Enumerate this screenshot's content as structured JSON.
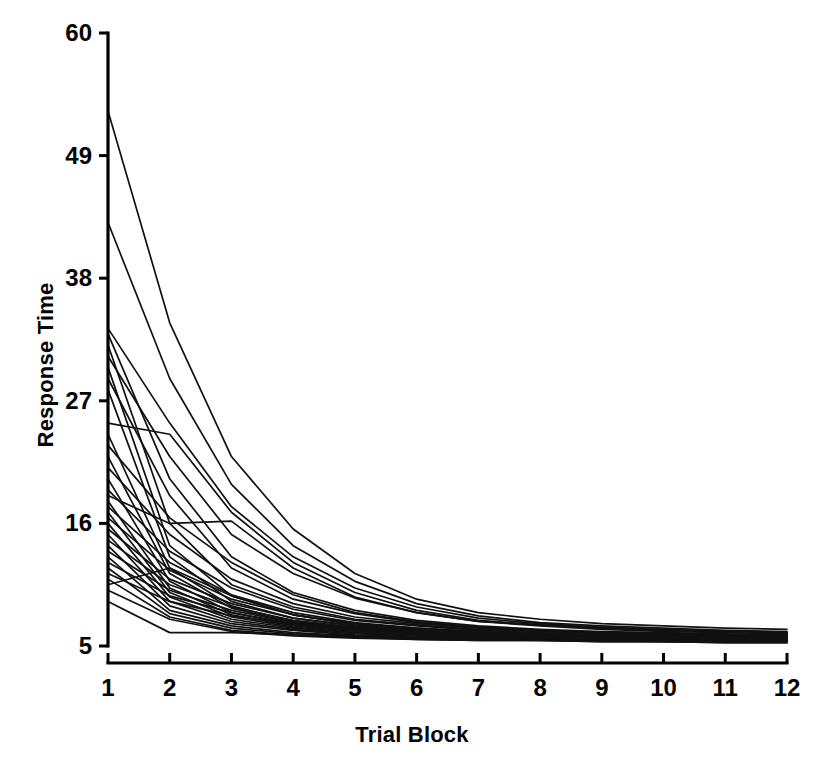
{
  "chart_data": {
    "type": "line",
    "title": "",
    "subtitle": "",
    "xlabel": "Trial Block",
    "ylabel": "Response Time",
    "x": [
      1,
      2,
      3,
      4,
      5,
      6,
      7,
      8,
      9,
      10,
      11,
      12
    ],
    "xticklabels": [
      "1",
      "2",
      "3",
      "4",
      "5",
      "6",
      "7",
      "8",
      "9",
      "10",
      "11",
      "12"
    ],
    "yticks": [
      5,
      16,
      27,
      38,
      49,
      60
    ],
    "yticklabels": [
      "5",
      "16",
      "27",
      "38",
      "49",
      "60"
    ],
    "xlim": [
      1,
      12
    ],
    "ylim": [
      5,
      60
    ],
    "grid": false,
    "legend": false,
    "legend_position": "none",
    "line_color": "#111111",
    "background_color": "#ffffff",
    "axis_color": "#000000",
    "series": [
      {
        "name": "s1",
        "values": [
          53.0,
          34.0,
          22.0,
          15.5,
          11.5,
          9.2,
          8.0,
          7.4,
          7.0,
          6.8,
          6.6,
          6.5
        ]
      },
      {
        "name": "s2",
        "values": [
          43.0,
          29.0,
          19.5,
          14.0,
          10.8,
          8.8,
          7.7,
          7.1,
          6.8,
          6.6,
          6.4,
          6.3
        ]
      },
      {
        "name": "s3",
        "values": [
          33.5,
          25.0,
          17.5,
          13.0,
          10.2,
          8.5,
          7.5,
          7.0,
          6.7,
          6.5,
          6.3,
          6.2
        ]
      },
      {
        "name": "s4",
        "values": [
          33.0,
          20.0,
          13.0,
          9.8,
          8.2,
          7.3,
          6.8,
          6.5,
          6.3,
          6.2,
          6.1,
          6.0
        ]
      },
      {
        "name": "s5",
        "values": [
          32.0,
          16.0,
          10.5,
          8.5,
          7.4,
          6.9,
          6.5,
          6.3,
          6.2,
          6.1,
          6.0,
          6.0
        ]
      },
      {
        "name": "s6",
        "values": [
          31.0,
          22.0,
          15.0,
          11.5,
          9.3,
          8.0,
          7.2,
          6.9,
          6.6,
          6.4,
          6.3,
          6.2
        ]
      },
      {
        "name": "s7",
        "values": [
          30.0,
          14.0,
          9.5,
          7.8,
          7.0,
          6.6,
          6.3,
          6.1,
          6.0,
          6.0,
          5.9,
          5.9
        ]
      },
      {
        "name": "s8",
        "values": [
          29.0,
          18.5,
          12.0,
          9.2,
          7.9,
          7.1,
          6.7,
          6.4,
          6.2,
          6.1,
          6.0,
          6.0
        ]
      },
      {
        "name": "s9",
        "values": [
          28.0,
          13.0,
          9.0,
          7.5,
          6.8,
          6.4,
          6.2,
          6.0,
          5.9,
          5.9,
          5.8,
          5.8
        ]
      },
      {
        "name": "s10",
        "values": [
          25.0,
          24.0,
          17.0,
          12.5,
          9.8,
          8.2,
          7.3,
          6.9,
          6.6,
          6.4,
          6.3,
          6.2
        ]
      },
      {
        "name": "s11",
        "values": [
          24.0,
          12.0,
          8.6,
          7.2,
          6.6,
          6.3,
          6.1,
          6.0,
          5.9,
          5.8,
          5.8,
          5.7
        ]
      },
      {
        "name": "s12",
        "values": [
          23.0,
          16.5,
          12.5,
          9.6,
          8.0,
          7.2,
          6.7,
          6.4,
          6.2,
          6.1,
          6.0,
          6.0
        ]
      },
      {
        "name": "s13",
        "values": [
          22.0,
          11.5,
          8.4,
          7.1,
          6.5,
          6.2,
          6.0,
          5.9,
          5.8,
          5.8,
          5.7,
          5.7
        ]
      },
      {
        "name": "s14",
        "values": [
          21.0,
          15.0,
          11.0,
          8.8,
          7.6,
          7.0,
          6.6,
          6.3,
          6.1,
          6.0,
          6.0,
          5.9
        ]
      },
      {
        "name": "s15",
        "values": [
          20.0,
          10.8,
          8.0,
          6.9,
          6.4,
          6.1,
          6.0,
          5.9,
          5.8,
          5.7,
          5.7,
          5.6
        ]
      },
      {
        "name": "s16",
        "values": [
          19.0,
          13.5,
          10.2,
          8.3,
          7.3,
          6.8,
          6.4,
          6.2,
          6.0,
          6.0,
          5.9,
          5.9
        ]
      },
      {
        "name": "s17",
        "values": [
          18.5,
          16.0,
          16.2,
          12.0,
          9.4,
          8.0,
          7.2,
          6.8,
          6.5,
          6.3,
          6.2,
          6.1
        ]
      },
      {
        "name": "s18",
        "values": [
          18.0,
          10.2,
          7.8,
          6.8,
          6.3,
          6.1,
          5.9,
          5.8,
          5.8,
          5.7,
          5.7,
          5.6
        ]
      },
      {
        "name": "s19",
        "values": [
          17.5,
          12.5,
          9.6,
          8.0,
          7.1,
          6.6,
          6.3,
          6.1,
          6.0,
          5.9,
          5.9,
          5.8
        ]
      },
      {
        "name": "s20",
        "values": [
          17.0,
          9.8,
          7.6,
          6.7,
          6.2,
          6.0,
          5.9,
          5.8,
          5.7,
          5.7,
          5.6,
          5.6
        ]
      },
      {
        "name": "s21",
        "values": [
          16.5,
          11.8,
          9.2,
          7.8,
          7.0,
          6.5,
          6.2,
          6.0,
          5.9,
          5.9,
          5.8,
          5.8
        ]
      },
      {
        "name": "s22",
        "values": [
          16.0,
          9.4,
          7.4,
          6.6,
          6.2,
          6.0,
          5.8,
          5.8,
          5.7,
          5.6,
          5.6,
          5.6
        ]
      },
      {
        "name": "s23",
        "values": [
          15.5,
          11.0,
          8.8,
          7.5,
          6.8,
          6.4,
          6.1,
          6.0,
          5.9,
          5.8,
          5.8,
          5.7
        ]
      },
      {
        "name": "s24",
        "values": [
          15.0,
          9.0,
          7.2,
          6.5,
          6.1,
          5.9,
          5.8,
          5.7,
          5.7,
          5.6,
          5.6,
          5.5
        ]
      },
      {
        "name": "s25",
        "values": [
          14.5,
          10.5,
          8.5,
          7.3,
          6.7,
          6.3,
          6.1,
          5.9,
          5.9,
          5.8,
          5.7,
          5.7
        ]
      },
      {
        "name": "s26",
        "values": [
          14.0,
          8.6,
          7.0,
          6.4,
          6.0,
          5.9,
          5.7,
          5.7,
          5.6,
          5.6,
          5.5,
          5.5
        ]
      },
      {
        "name": "s27",
        "values": [
          13.5,
          10.0,
          8.2,
          7.1,
          6.6,
          6.2,
          6.0,
          5.9,
          5.8,
          5.8,
          5.7,
          5.7
        ]
      },
      {
        "name": "s28",
        "values": [
          13.0,
          8.2,
          6.8,
          6.2,
          5.9,
          5.8,
          5.7,
          5.6,
          5.6,
          5.5,
          5.5,
          5.5
        ]
      },
      {
        "name": "s29",
        "values": [
          12.5,
          9.5,
          8.0,
          7.0,
          6.5,
          6.1,
          6.0,
          5.8,
          5.8,
          5.7,
          5.7,
          5.6
        ]
      },
      {
        "name": "s30",
        "values": [
          12.0,
          7.9,
          6.6,
          6.1,
          5.9,
          5.7,
          5.6,
          5.6,
          5.5,
          5.5,
          5.4,
          5.4
        ]
      },
      {
        "name": "s31",
        "values": [
          11.5,
          9.0,
          7.7,
          6.9,
          6.4,
          6.1,
          5.9,
          5.8,
          5.7,
          5.7,
          5.6,
          5.6
        ]
      },
      {
        "name": "s32",
        "values": [
          11.0,
          7.6,
          6.4,
          6.0,
          5.8,
          5.7,
          5.6,
          5.5,
          5.5,
          5.4,
          5.4,
          5.4
        ]
      },
      {
        "name": "s33",
        "values": [
          10.5,
          12.0,
          9.5,
          7.8,
          6.9,
          6.4,
          6.1,
          6.0,
          5.9,
          5.8,
          5.8,
          5.7
        ]
      },
      {
        "name": "s34",
        "values": [
          10.0,
          7.4,
          6.3,
          5.9,
          5.7,
          5.6,
          5.5,
          5.5,
          5.4,
          5.4,
          5.3,
          5.3
        ]
      },
      {
        "name": "s35",
        "values": [
          9.0,
          6.2,
          6.2,
          6.0,
          5.8,
          5.6,
          5.5,
          5.5,
          5.4,
          5.4,
          5.3,
          5.3
        ]
      }
    ]
  }
}
